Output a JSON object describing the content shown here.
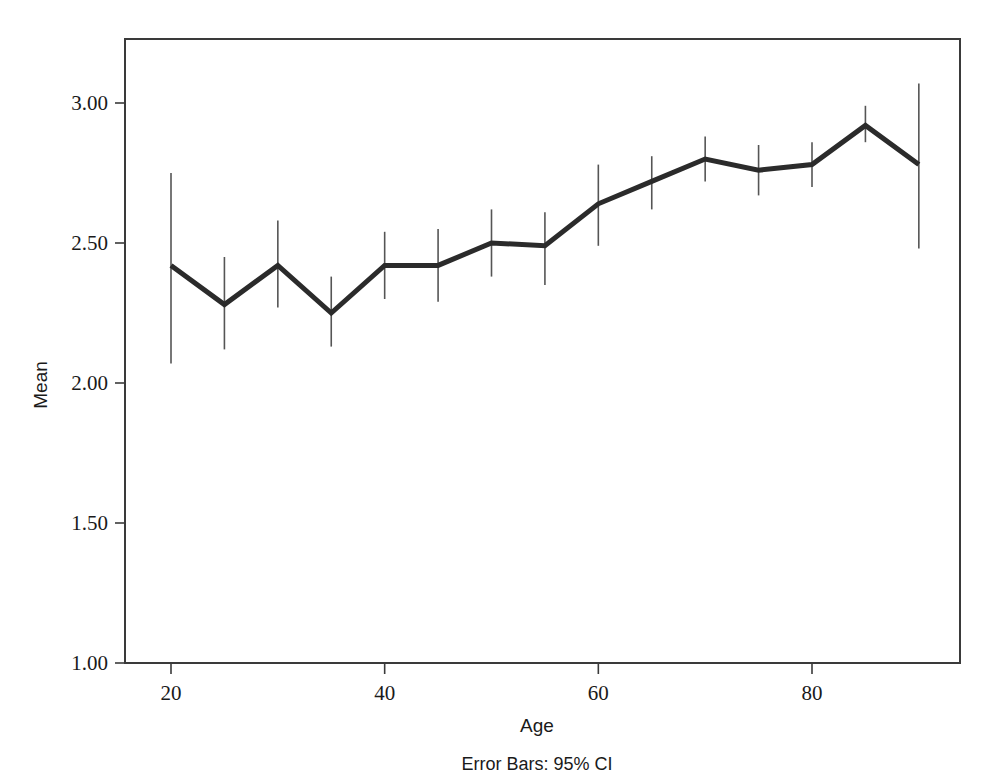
{
  "figure": {
    "caption": "Error Bars: 95% CI"
  },
  "chart_data": {
    "type": "line",
    "title": "",
    "subtitle": "",
    "xlabel": "Age",
    "ylabel": "Mean",
    "annotation": "Error Bars: 95% CI",
    "grid": false,
    "legend": null,
    "error_bar_type": "95% CI",
    "xlim": [
      17,
      93
    ],
    "ylim": [
      1.0,
      3.2
    ],
    "xticks": [
      20,
      40,
      60,
      80
    ],
    "xtick_labels": [
      "20",
      "40",
      "60",
      "80"
    ],
    "yticks": [
      1.0,
      1.5,
      2.0,
      2.5,
      3.0
    ],
    "ytick_labels": [
      "1.00",
      "1.50",
      "2.00",
      "2.50",
      "3.00"
    ],
    "x": [
      20,
      25,
      30,
      35,
      40,
      45,
      50,
      55,
      60,
      65,
      70,
      75,
      80,
      85,
      90
    ],
    "values": [
      2.42,
      2.28,
      2.42,
      2.25,
      2.42,
      2.42,
      2.5,
      2.49,
      2.64,
      2.72,
      2.8,
      2.76,
      2.78,
      2.92,
      2.78
    ],
    "ci_lower": [
      2.07,
      2.12,
      2.27,
      2.13,
      2.3,
      2.29,
      2.38,
      2.35,
      2.49,
      2.62,
      2.72,
      2.67,
      2.7,
      2.86,
      2.48
    ],
    "ci_upper": [
      2.75,
      2.45,
      2.58,
      2.38,
      2.54,
      2.55,
      2.62,
      2.61,
      2.78,
      2.81,
      2.88,
      2.85,
      2.86,
      2.99,
      3.07
    ],
    "series": [
      {
        "name": "Mean",
        "color": "#2b2b2b",
        "values": [
          2.42,
          2.28,
          2.42,
          2.25,
          2.42,
          2.42,
          2.5,
          2.49,
          2.64,
          2.72,
          2.8,
          2.76,
          2.78,
          2.92,
          2.78
        ]
      }
    ],
    "colors": {
      "line": "#2b2b2b",
      "error_bar": "#555555",
      "axis": "#3a3a3a",
      "background": "#ffffff",
      "text": "#1a1a1a"
    }
  }
}
